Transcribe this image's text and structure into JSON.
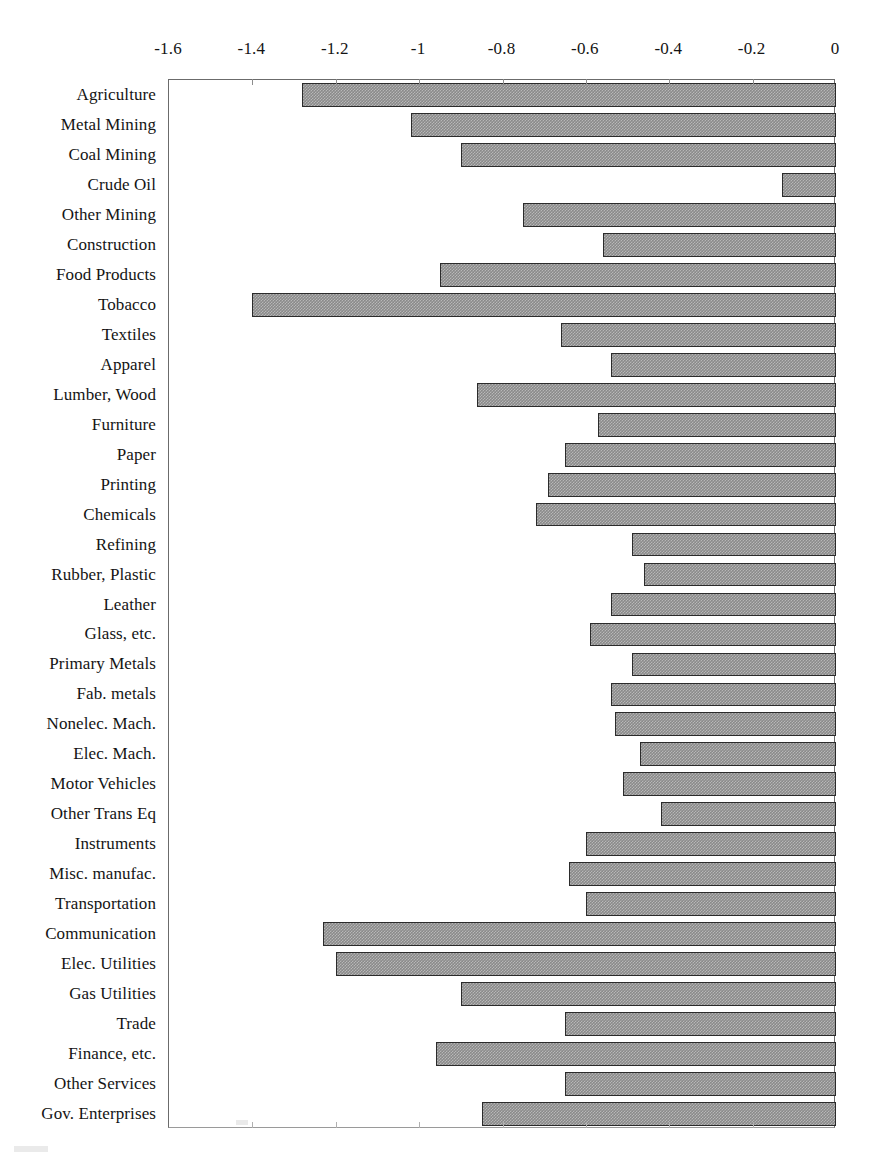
{
  "chart_data": {
    "type": "bar",
    "orientation": "horizontal",
    "title": "",
    "subtitle": "",
    "xlabel": "",
    "ylabel": "",
    "xlim": [
      -1.6,
      0
    ],
    "ylim": null,
    "grid": false,
    "legend": null,
    "legend_position": "none",
    "x_tick_labels": [
      "-1.6",
      "-1.4",
      "-1.2",
      "-1",
      "-0.8",
      "-0.6",
      "-0.4",
      "-0.2",
      "0"
    ],
    "x_tick_values": [
      -1.6,
      -1.4,
      -1.2,
      -1.0,
      -0.8,
      -0.6,
      -0.4,
      -0.2,
      0
    ],
    "categories": [
      "Agriculture",
      "Metal Mining",
      "Coal Mining",
      "Crude Oil",
      "Other Mining",
      "Construction",
      "Food Products",
      "Tobacco",
      "Textiles",
      "Apparel",
      "Lumber, Wood",
      "Furniture",
      "Paper",
      "Printing",
      "Chemicals",
      "Refining",
      "Rubber, Plastic",
      "Leather",
      "Glass, etc.",
      "Primary Metals",
      "Fab. metals",
      "Nonelec. Mach.",
      "Elec. Mach.",
      "Motor Vehicles",
      "Other Trans Eq",
      "Instruments",
      "Misc. manufac.",
      "Transportation",
      "Communication",
      "Elec. Utilities",
      "Gas Utilities",
      "Trade",
      "Finance, etc.",
      "Other Services",
      "Gov. Enterprises"
    ],
    "values": [
      -1.28,
      -1.02,
      -0.9,
      -0.13,
      -0.75,
      -0.56,
      -0.95,
      -1.4,
      -0.66,
      -0.54,
      -0.86,
      -0.57,
      -0.65,
      -0.69,
      -0.72,
      -0.49,
      -0.46,
      -0.54,
      -0.59,
      -0.49,
      -0.54,
      -0.53,
      -0.47,
      -0.51,
      -0.42,
      -0.6,
      -0.64,
      -0.6,
      -1.23,
      -1.2,
      -0.9,
      -0.65,
      -0.96,
      -0.65,
      -0.85
    ]
  },
  "style": {
    "bar_fill": "#8a8a8a",
    "bar_border": "#2b2b2b",
    "axis_color": "#6b6b6b",
    "text_color": "#141414",
    "background": "#ffffff"
  }
}
